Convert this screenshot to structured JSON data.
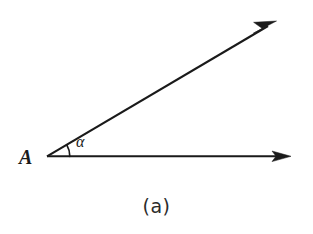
{
  "figure": {
    "caption": "(a)",
    "background_color": "#ffffff",
    "ink_color": "#1a1a1a",
    "width": 313,
    "height": 234,
    "vertex": {
      "label": "A",
      "x": 47,
      "y": 156
    },
    "angle": {
      "label": "α",
      "label_x": 76,
      "label_y": 135,
      "degrees": 30.5,
      "arc_radius": 23
    },
    "rays": [
      {
        "name": "horizontal-ray",
        "from_x": 47,
        "from_y": 156,
        "to_x": 291,
        "to_y": 156,
        "arrowhead": "filled-triangle"
      },
      {
        "name": "inclined-ray",
        "from_x": 47,
        "from_y": 156,
        "to_x": 276,
        "to_y": 21,
        "arrowhead": "filled-triangle"
      }
    ]
  }
}
